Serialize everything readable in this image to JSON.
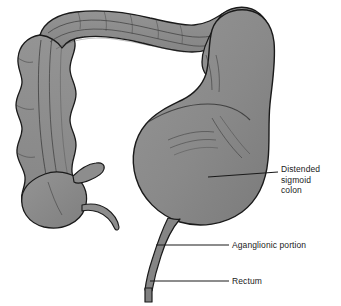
{
  "figure": {
    "background_color": "#ffffff",
    "organ_fill": "#8a8a8a",
    "organ_fill_shadow": "#757575",
    "organ_fill_highlight": "#9b9b9b",
    "outline_color": "#1a1a1a",
    "leader_color": "#1a1a1a",
    "text_color": "#1a1a1a"
  },
  "labels": [
    {
      "id": "distended-sigmoid-colon",
      "lines": [
        "Distended",
        "sigmoid",
        "colon"
      ],
      "line1": "Distended",
      "line2": "sigmoid",
      "line3": "colon"
    },
    {
      "id": "aganglionic-portion",
      "text": "Aganglionic portion"
    },
    {
      "id": "rectum",
      "text": "Rectum"
    }
  ],
  "anatomy": {
    "parts": [
      "transverse-colon",
      "hepatic-flexure",
      "splenic-flexure",
      "ascending-colon",
      "descending-colon",
      "cecum",
      "ileum-stub",
      "appendix",
      "distended-sigmoid-colon",
      "aganglionic-segment",
      "rectum"
    ]
  }
}
